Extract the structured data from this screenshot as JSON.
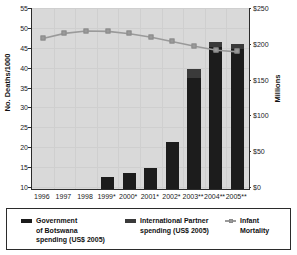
{
  "chart_data": {
    "type": "bar",
    "title": "",
    "subtitle": "",
    "categories": [
      "1996",
      "1997",
      "1998",
      "1999*",
      "2000*",
      "2001*",
      "2002*",
      "2003**",
      "2004**",
      "2005**"
    ],
    "xlabel": "",
    "ylabel": "No. Deaths/1000",
    "ylabel_right": "Millions",
    "ylim": [
      10,
      55
    ],
    "yticks": [
      10,
      15,
      20,
      25,
      30,
      35,
      40,
      45,
      50,
      55
    ],
    "ytick_labels": [
      "10",
      "15",
      "20",
      "25",
      "30",
      "35",
      "40",
      "45",
      "50",
      "55"
    ],
    "ylim_right": [
      0,
      250
    ],
    "yticks_right": [
      0,
      50,
      100,
      150,
      200,
      250
    ],
    "ytick_labels_right": [
      "$0",
      "$50",
      "$100",
      "$150",
      "$200",
      "$250"
    ],
    "grid": true,
    "legend_position": "bottom",
    "stacked": true,
    "series": [
      {
        "name": "Government of Botswana spending (US$ 2005)",
        "type": "bar",
        "axis": "right",
        "color": "#1c1c1c",
        "values": [
          0,
          0,
          0,
          17,
          23,
          29,
          65,
          155,
          198,
          196
        ]
      },
      {
        "name": "International Partner spending (US$ 2005)",
        "type": "bar",
        "axis": "right",
        "color": "#3a3a3a",
        "values": [
          0,
          0,
          0,
          0,
          0,
          0,
          0,
          13,
          7,
          7
        ]
      },
      {
        "name": "Infant Mortality",
        "type": "line",
        "axis": "left",
        "color": "#9a9a9a",
        "values": [
          47.4,
          48.7,
          49.3,
          49.2,
          48.6,
          47.7,
          46.6,
          45.5,
          44.5,
          44.1
        ]
      }
    ]
  },
  "legend": {
    "items": [
      {
        "label": "Government\nof Botswana\nspending (US$ 2005)",
        "swatch": "sw-gov",
        "name": "legend-government-botswana"
      },
      {
        "label": "International Partner\nspending (US$ 2005)",
        "swatch": "sw-partner",
        "name": "legend-international-partner"
      },
      {
        "label": "Infant\nMortality",
        "swatch": "sw-line",
        "name": "legend-infant-mortality"
      }
    ]
  },
  "axes": {
    "left_title": "No. Deaths/1000",
    "right_title": "Millions"
  }
}
